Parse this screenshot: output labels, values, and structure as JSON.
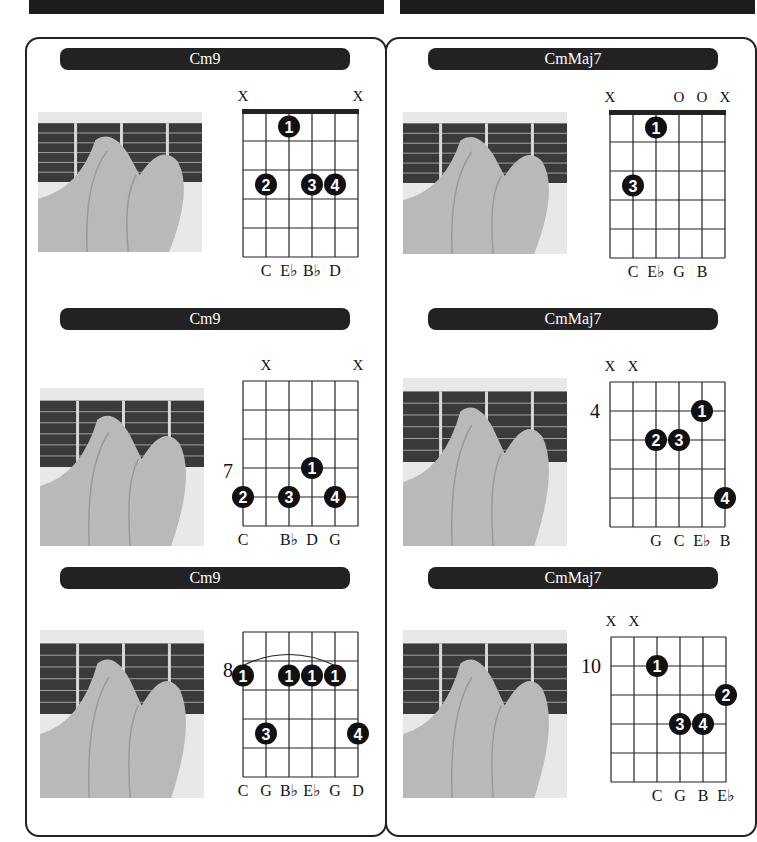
{
  "colors": {
    "dark": "#222222",
    "grid": "#222222",
    "pill_text": "#ffffff",
    "photo_bg": "#e8e8e8",
    "fretboard": "#3a3a3a",
    "skin": "#b9b9b9"
  },
  "columns": [
    {
      "name": "Cm9",
      "chords": [
        {
          "title": "Cm9",
          "nut": true,
          "fret_label": "",
          "string_marks": [
            "X",
            "",
            "",
            "",
            "",
            "X"
          ],
          "note_names": [
            "",
            "C",
            "E♭",
            "B♭",
            "D",
            ""
          ],
          "fingers": [
            {
              "finger": "1",
              "string": 3,
              "fret": 1
            },
            {
              "finger": "2",
              "string": 2,
              "fret": 3
            },
            {
              "finger": "3",
              "string": 4,
              "fret": 3
            },
            {
              "finger": "4",
              "string": 5,
              "fret": 3
            }
          ],
          "barre": null
        },
        {
          "title": "Cm9",
          "nut": false,
          "fret_label": "7",
          "string_marks": [
            "",
            "X",
            "",
            "",
            "",
            "X"
          ],
          "note_names": [
            "C",
            "",
            "B♭",
            "D",
            "G",
            ""
          ],
          "fingers": [
            {
              "finger": "1",
              "string": 4,
              "fret": 3.5
            },
            {
              "finger": "2",
              "string": 1,
              "fret": 4.5
            },
            {
              "finger": "3",
              "string": 3,
              "fret": 4.5
            },
            {
              "finger": "4",
              "string": 5,
              "fret": 4.5
            }
          ],
          "barre": null
        },
        {
          "title": "Cm9",
          "nut": false,
          "fret_label": "8",
          "string_marks": [
            "",
            "",
            "",
            "",
            "",
            ""
          ],
          "note_names": [
            "C",
            "G",
            "B♭",
            "E♭",
            "G",
            "D"
          ],
          "fingers": [
            {
              "finger": "1",
              "string": 1,
              "fret": 2
            },
            {
              "finger": "1",
              "string": 3,
              "fret": 2
            },
            {
              "finger": "1",
              "string": 4,
              "fret": 2
            },
            {
              "finger": "1",
              "string": 5,
              "fret": 2
            },
            {
              "finger": "3",
              "string": 2,
              "fret": 4
            },
            {
              "finger": "4",
              "string": 6,
              "fret": 4
            }
          ],
          "barre": {
            "from": 1,
            "to": 5,
            "fret": 2
          }
        }
      ]
    },
    {
      "name": "CmMaj7",
      "chords": [
        {
          "title": "CmMaj7",
          "nut": true,
          "fret_label": "",
          "string_marks": [
            "X",
            "",
            "",
            "O",
            "O",
            "X"
          ],
          "note_names": [
            "",
            "C",
            "E♭",
            "G",
            "B",
            ""
          ],
          "fingers": [
            {
              "finger": "1",
              "string": 3,
              "fret": 1
            },
            {
              "finger": "3",
              "string": 2,
              "fret": 3
            }
          ],
          "barre": null
        },
        {
          "title": "CmMaj7",
          "nut": false,
          "fret_label": "4",
          "string_marks": [
            "X",
            "X",
            "",
            "",
            "",
            ""
          ],
          "note_names": [
            "",
            "",
            "G",
            "C",
            "E♭",
            "B"
          ],
          "fingers": [
            {
              "finger": "1",
              "string": 5,
              "fret": 1.5
            },
            {
              "finger": "2",
              "string": 3,
              "fret": 2.5
            },
            {
              "finger": "3",
              "string": 4,
              "fret": 2.5
            },
            {
              "finger": "4",
              "string": 6,
              "fret": 4.5
            }
          ],
          "barre": null
        },
        {
          "title": "CmMaj7",
          "nut": false,
          "fret_label": "10",
          "string_marks": [
            "X",
            "X",
            "",
            "",
            "",
            ""
          ],
          "note_names": [
            "",
            "",
            "C",
            "G",
            "B",
            "E♭"
          ],
          "fingers": [
            {
              "finger": "1",
              "string": 3,
              "fret": 1.5
            },
            {
              "finger": "2",
              "string": 6,
              "fret": 2.5
            },
            {
              "finger": "3",
              "string": 4,
              "fret": 3.5
            },
            {
              "finger": "4",
              "string": 5,
              "fret": 3.5
            }
          ],
          "barre": null
        }
      ]
    }
  ]
}
